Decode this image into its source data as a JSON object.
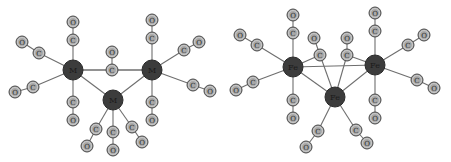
{
  "diagram": {
    "molecules": [
      {
        "id": "m3-co12-generic",
        "metal_label": "M",
        "ligand_atom_labels": {
          "carbon": "C",
          "oxygen": "O"
        },
        "metals": [
          {
            "id": "M1",
            "label": "M"
          },
          {
            "id": "M2",
            "label": "M"
          },
          {
            "id": "M3",
            "label": "M"
          }
        ],
        "metal_metal_bonds": [
          [
            "M1",
            "M2"
          ],
          [
            "M1",
            "M3"
          ],
          [
            "M2",
            "M3"
          ]
        ],
        "carbonyls": [
          {
            "metal": "M1",
            "type": "terminal",
            "direction": "up"
          },
          {
            "metal": "M1",
            "type": "terminal",
            "direction": "upper-left"
          },
          {
            "metal": "M1",
            "type": "terminal",
            "direction": "lower-left"
          },
          {
            "metal": "M1",
            "type": "terminal",
            "direction": "down"
          },
          {
            "metal": "M2",
            "type": "terminal",
            "direction": "up"
          },
          {
            "metal": "M2",
            "type": "terminal",
            "direction": "upper-right"
          },
          {
            "metal": "M2",
            "type": "terminal",
            "direction": "lower-right"
          },
          {
            "metal": "M2",
            "type": "terminal",
            "direction": "down"
          },
          {
            "metal": "M3",
            "type": "terminal",
            "direction": "lower-left"
          },
          {
            "metal": "M3",
            "type": "terminal",
            "direction": "down"
          },
          {
            "metal": "M3",
            "type": "terminal",
            "direction": "lower-right"
          },
          {
            "metal": "M1-M2",
            "type": "bridging-center",
            "direction": "up"
          }
        ]
      },
      {
        "id": "fe3-co12",
        "metal_label": "Fe",
        "ligand_atom_labels": {
          "carbon": "C",
          "oxygen": "O"
        },
        "metals": [
          {
            "id": "Fe1",
            "label": "Fe"
          },
          {
            "id": "Fe2",
            "label": "Fe"
          },
          {
            "id": "Fe3",
            "label": "Fe"
          }
        ],
        "metal_metal_bonds": [
          [
            "Fe1",
            "Fe2"
          ],
          [
            "Fe1",
            "Fe3"
          ],
          [
            "Fe2",
            "Fe3"
          ]
        ],
        "carbonyls": [
          {
            "metal": "Fe1",
            "type": "terminal",
            "direction": "up"
          },
          {
            "metal": "Fe1",
            "type": "terminal",
            "direction": "upper-left"
          },
          {
            "metal": "Fe1",
            "type": "terminal",
            "direction": "lower-left"
          },
          {
            "metal": "Fe1",
            "type": "terminal",
            "direction": "down"
          },
          {
            "metal": "Fe2",
            "type": "terminal",
            "direction": "up"
          },
          {
            "metal": "Fe2",
            "type": "terminal",
            "direction": "upper-right"
          },
          {
            "metal": "Fe2",
            "type": "terminal",
            "direction": "lower-right"
          },
          {
            "metal": "Fe2",
            "type": "terminal",
            "direction": "down"
          },
          {
            "metal": "Fe3",
            "type": "terminal",
            "direction": "lower-left"
          },
          {
            "metal": "Fe3",
            "type": "terminal",
            "direction": "lower-right"
          },
          {
            "metal": "Fe1-Fe3",
            "type": "bridging",
            "direction": "up-left"
          },
          {
            "metal": "Fe2-Fe3",
            "type": "bridging",
            "direction": "up-right"
          }
        ]
      }
    ],
    "colors": {
      "metal": "#3c3c3c",
      "ligand": "#a8a8a8",
      "bond": "#6e6e6e",
      "background": "#ffffff"
    }
  }
}
